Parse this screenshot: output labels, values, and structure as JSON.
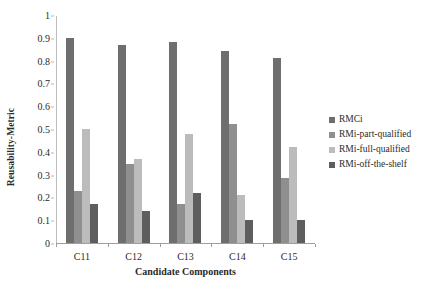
{
  "chart_data": {
    "type": "bar",
    "title": "",
    "subtitle": "",
    "xlabel": "Candidate Components",
    "ylabel": "Reusability-Metric",
    "categories": [
      "C11",
      "C12",
      "C13",
      "C14",
      "C15"
    ],
    "series": [
      {
        "name": "RMCi",
        "color": "#6e6e6e",
        "values": [
          0.9,
          0.87,
          0.88,
          0.84,
          0.81
        ]
      },
      {
        "name": "RMi-part-qualified",
        "color": "#8f8f8f",
        "values": [
          0.23,
          0.345,
          0.17,
          0.52,
          0.285
        ]
      },
      {
        "name": "RMi-full-qualified",
        "color": "#bcbcbc",
        "values": [
          0.5,
          0.37,
          0.48,
          0.21,
          0.42
        ]
      },
      {
        "name": "RMi-off-the-shelf",
        "color": "#5e5e5e",
        "values": [
          0.17,
          0.14,
          0.22,
          0.1,
          0.1
        ]
      }
    ],
    "ylim": [
      0,
      1
    ],
    "yticks": [
      "0",
      "0.1",
      "0.2",
      "0.3",
      "0.4",
      "0.5",
      "0.6",
      "0.7",
      "0.8",
      "0.9",
      "1"
    ],
    "ytick_values": [
      0,
      0.1,
      0.2,
      0.3,
      0.4,
      0.5,
      0.6,
      0.7,
      0.8,
      0.9,
      1
    ],
    "grid": false,
    "legend_position": "right",
    "axis_color": "#9e9e9e",
    "background": "#ffffff"
  }
}
